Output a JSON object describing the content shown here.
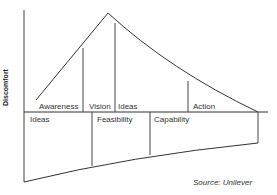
{
  "diagram": {
    "y_axis_label": "Discomfort",
    "upper_phases": [
      {
        "label": "Awareness"
      },
      {
        "label": "Vision"
      },
      {
        "label": "Ideas"
      },
      {
        "label": "Action"
      }
    ],
    "lower_phases": [
      {
        "label": "Ideas"
      },
      {
        "label": "Feasibility"
      },
      {
        "label": "Capability"
      }
    ],
    "source": "Source: Unilever",
    "line_color": "#333333"
  }
}
